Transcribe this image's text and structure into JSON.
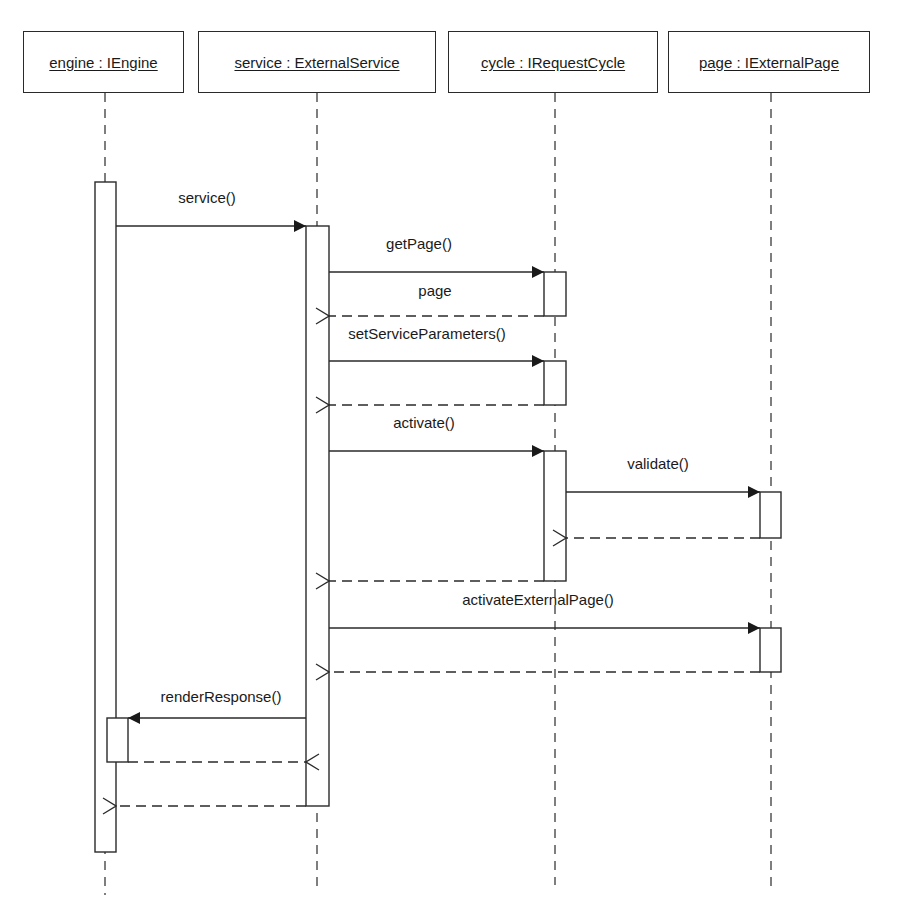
{
  "diagram": {
    "type": "UML sequence diagram",
    "participants": [
      {
        "id": "engine",
        "label": "engine : IEngine",
        "box": {
          "x": 23,
          "y": 31,
          "w": 161,
          "h": 62
        },
        "lifeline_x": 105
      },
      {
        "id": "service",
        "label": "service : ExternalService",
        "box": {
          "x": 198,
          "y": 31,
          "w": 238,
          "h": 62
        },
        "lifeline_x": 317
      },
      {
        "id": "cycle",
        "label": "cycle : IRequestCycle",
        "box": {
          "x": 448,
          "y": 31,
          "w": 210,
          "h": 62
        },
        "lifeline_x": 555
      },
      {
        "id": "page",
        "label": "page : IExternalPage",
        "box": {
          "x": 668,
          "y": 31,
          "w": 202,
          "h": 62
        },
        "lifeline_x": 771
      }
    ],
    "messages": [
      {
        "id": "msg-service",
        "label": "service()",
        "kind": "call",
        "from": "engine",
        "to": "service",
        "y": 226,
        "label_x": 207,
        "label_y": 189
      },
      {
        "id": "msg-getpage",
        "label": "getPage()",
        "kind": "call",
        "from": "service",
        "to": "cycle",
        "y": 272,
        "label_x": 419,
        "label_y": 235
      },
      {
        "id": "msg-getpage-return",
        "label": "page",
        "kind": "return",
        "from": "cycle",
        "to": "service",
        "y": 316,
        "label_x": 435,
        "label_y": 282
      },
      {
        "id": "msg-setserviceparams",
        "label": "setServiceParameters()",
        "kind": "call",
        "from": "service",
        "to": "cycle",
        "y": 361,
        "label_x": 427,
        "label_y": 325
      },
      {
        "id": "msg-setserviceparams-return",
        "label": "",
        "kind": "return",
        "from": "cycle",
        "to": "service",
        "y": 405
      },
      {
        "id": "msg-activate",
        "label": "activate()",
        "kind": "call",
        "from": "service",
        "to": "cycle",
        "y": 451,
        "label_x": 424,
        "label_y": 414
      },
      {
        "id": "msg-validate",
        "label": "validate()",
        "kind": "call",
        "from": "cycle",
        "to": "page",
        "y": 492,
        "label_x": 658,
        "label_y": 455
      },
      {
        "id": "msg-validate-return",
        "label": "",
        "kind": "return",
        "from": "page",
        "to": "cycle",
        "y": 538
      },
      {
        "id": "msg-activate-return",
        "label": "",
        "kind": "return",
        "from": "cycle",
        "to": "service",
        "y": 581
      },
      {
        "id": "msg-activateexternalpage",
        "label": "activateExternalPage()",
        "kind": "call",
        "from": "service",
        "to": "page",
        "y": 628,
        "label_x": 538,
        "label_y": 591
      },
      {
        "id": "msg-activateexternalpage-return",
        "label": "",
        "kind": "return",
        "from": "page",
        "to": "service",
        "y": 672
      },
      {
        "id": "msg-renderresponse",
        "label": "renderResponse()",
        "kind": "call",
        "from": "service",
        "to": "engine",
        "y": 718,
        "label_x": 221,
        "label_y": 688
      },
      {
        "id": "msg-renderresponse-return",
        "label": "",
        "kind": "return",
        "from": "engine",
        "to": "service",
        "y": 762
      },
      {
        "id": "msg-service-return",
        "label": "",
        "kind": "return",
        "from": "service",
        "to": "engine",
        "y": 806
      }
    ],
    "activations": [
      {
        "id": "act-engine-main",
        "participant": "engine",
        "x": 95,
        "y": 182,
        "w": 21,
        "h": 670
      },
      {
        "id": "act-engine-render",
        "participant": "engine",
        "x": 107,
        "y": 718,
        "w": 21,
        "h": 44
      },
      {
        "id": "act-service-main",
        "participant": "service",
        "x": 306,
        "y": 226,
        "w": 23,
        "h": 580
      },
      {
        "id": "act-cycle-getpage",
        "participant": "cycle",
        "x": 544,
        "y": 272,
        "w": 22,
        "h": 44
      },
      {
        "id": "act-cycle-setparams",
        "participant": "cycle",
        "x": 544,
        "y": 361,
        "w": 22,
        "h": 44
      },
      {
        "id": "act-cycle-activate",
        "participant": "cycle",
        "x": 544,
        "y": 451,
        "w": 22,
        "h": 130
      },
      {
        "id": "act-page-validate",
        "participant": "page",
        "x": 760,
        "y": 492,
        "w": 21,
        "h": 46
      },
      {
        "id": "act-page-activateext",
        "participant": "page",
        "x": 760,
        "y": 628,
        "w": 21,
        "h": 44
      }
    ],
    "lifeline_end_y": {
      "engine": 895,
      "service": 893,
      "cycle": 885,
      "page": 887
    },
    "colors": {
      "line": "#2a2a2a",
      "dash": "#3a3a3a",
      "background": "#ffffff",
      "text": "#1a1a1a"
    }
  }
}
